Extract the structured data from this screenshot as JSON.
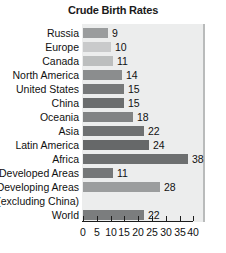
{
  "chart_data": {
    "type": "bar",
    "orientation": "horizontal",
    "title": "Crude Birth Rates",
    "xlabel": "",
    "ylabel": "",
    "xlim": [
      0,
      40
    ],
    "grid": false,
    "legend": null,
    "xticks": [
      "0",
      "5",
      "10",
      "15",
      "20",
      "25",
      "30",
      "35",
      "40"
    ],
    "xtick_values": [
      0,
      5,
      10,
      15,
      20,
      25,
      30,
      35,
      40
    ],
    "categories": [
      "Russia",
      "Europe",
      "Canada",
      "North America",
      "United States",
      "China",
      "Oceania",
      "Asia",
      "Latin America",
      "Africa",
      "Developed Areas",
      "Developing Areas",
      "(excluding China)",
      "World"
    ],
    "values": [
      9,
      10,
      11,
      14,
      15,
      15,
      18,
      22,
      24,
      38,
      11,
      28,
      null,
      22
    ],
    "value_labels": [
      "9",
      "10",
      "11",
      "14",
      "15",
      "15",
      "18",
      "22",
      "24",
      "38",
      "11",
      "28",
      "",
      "22"
    ],
    "bar_colors": [
      "#9a9c9d",
      "#c9cacb",
      "#bcbebe",
      "#8b8d8e",
      "#77797a",
      "#6b6d6e",
      "#818384",
      "#6f7172",
      "#666869",
      "#6d6f70",
      "#757778",
      "#9b9d9e",
      "#eceded",
      "#7b7d7e"
    ],
    "rows": [
      {
        "label": "Russia",
        "value": 9,
        "value_label": "9",
        "color": "#9a9c9d",
        "has_bar": true
      },
      {
        "label": "Europe",
        "value": 10,
        "value_label": "10",
        "color": "#c9cacb",
        "has_bar": true
      },
      {
        "label": "Canada",
        "value": 11,
        "value_label": "11",
        "color": "#bcbebe",
        "has_bar": true
      },
      {
        "label": "North America",
        "value": 14,
        "value_label": "14",
        "color": "#8b8d8e",
        "has_bar": true
      },
      {
        "label": "United States",
        "value": 15,
        "value_label": "15",
        "color": "#77797a",
        "has_bar": true
      },
      {
        "label": "China",
        "value": 15,
        "value_label": "15",
        "color": "#6b6d6e",
        "has_bar": true
      },
      {
        "label": "Oceania",
        "value": 18,
        "value_label": "18",
        "color": "#818384",
        "has_bar": true
      },
      {
        "label": "Asia",
        "value": 22,
        "value_label": "22",
        "color": "#6f7172",
        "has_bar": true
      },
      {
        "label": "Latin America",
        "value": 24,
        "value_label": "24",
        "color": "#666869",
        "has_bar": true
      },
      {
        "label": "Africa",
        "value": 38,
        "value_label": "38",
        "color": "#6d6f70",
        "has_bar": true
      },
      {
        "label": "Developed Areas",
        "value": 11,
        "value_label": "11",
        "color": "#757778",
        "has_bar": true
      },
      {
        "label": "Developing Areas",
        "value": 28,
        "value_label": "28",
        "color": "#9b9d9e",
        "has_bar": true
      },
      {
        "label": "(excluding China)",
        "value": null,
        "value_label": "",
        "color": "#eceded",
        "has_bar": false
      },
      {
        "label": "World",
        "value": 22,
        "value_label": "22",
        "color": "#7b7d7e",
        "has_bar": true
      }
    ]
  },
  "colors": {
    "plot_background": "#eceded",
    "page_background": "#ffffff",
    "axis": "#1c1c1c",
    "text": "#111111",
    "panel_border": "#b9bbbb"
  }
}
